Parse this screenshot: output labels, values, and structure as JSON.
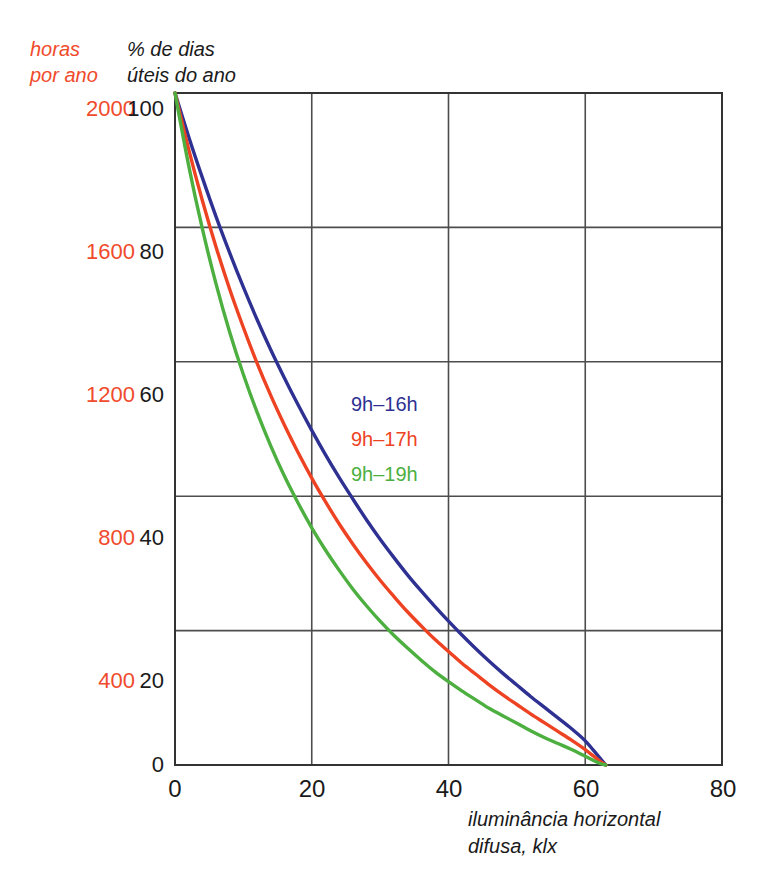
{
  "chart_data": {
    "type": "line",
    "title": "",
    "xlabel": "iluminância horizontal\ndifusa, klx",
    "ylabel": "% de dias\núteis do ano",
    "secondary_ylabel": "horas\npor ano",
    "xlim": [
      0,
      80
    ],
    "ylim": [
      0,
      100
    ],
    "secondary_ylim": [
      0,
      2000
    ],
    "xticks": [
      "0",
      "20",
      "40",
      "60",
      "80"
    ],
    "xtick_values": [
      0,
      20,
      40,
      60,
      80
    ],
    "yticks": [
      "0",
      "20",
      "40",
      "60",
      "80",
      "100"
    ],
    "ytick_values": [
      0,
      20,
      40,
      60,
      80,
      100
    ],
    "secondary_yticks": [
      "400",
      "800",
      "1200",
      "1600",
      "2000"
    ],
    "secondary_ytick_values": [
      400,
      800,
      1200,
      1600,
      2000
    ],
    "grid": true,
    "legend_position": "inside-center",
    "x": [
      0,
      2,
      4,
      6,
      8,
      10,
      12,
      14,
      16,
      18,
      20,
      22,
      24,
      26,
      28,
      30,
      32,
      34,
      36,
      38,
      40,
      42,
      44,
      46,
      48,
      50,
      52,
      54,
      56,
      58,
      60,
      62,
      63
    ],
    "series": [
      {
        "name": "9h–16h",
        "color": "#2e3192",
        "values": [
          100,
          93.5,
          87.4,
          81.6,
          76.2,
          71.1,
          66.3,
          61.8,
          57.6,
          53.6,
          49.8,
          46.2,
          42.8,
          39.6,
          36.5,
          33.6,
          30.9,
          28.3,
          25.9,
          23.6,
          21.4,
          19.3,
          17.3,
          15.4,
          13.6,
          11.9,
          10.2,
          8.6,
          7.0,
          5.4,
          3.6,
          1.2,
          0
        ]
      },
      {
        "name": "9h–17h",
        "color": "#ee4323",
        "values": [
          100,
          91.6,
          84.0,
          77.1,
          70.8,
          65.1,
          59.8,
          55.0,
          50.6,
          46.5,
          42.7,
          39.2,
          35.9,
          32.9,
          30.1,
          27.5,
          25.1,
          22.8,
          20.7,
          18.7,
          16.9,
          15.1,
          13.5,
          11.9,
          10.4,
          9.0,
          7.6,
          6.3,
          5.0,
          3.7,
          2.3,
          0.7,
          0
        ]
      },
      {
        "name": "9h–19h",
        "color": "#4caf3f",
        "values": [
          100,
          89.2,
          79.8,
          71.6,
          64.4,
          58.1,
          52.5,
          47.5,
          43.0,
          39.0,
          35.3,
          32.0,
          29.0,
          26.2,
          23.7,
          21.4,
          19.3,
          17.4,
          15.6,
          13.9,
          12.4,
          11.0,
          9.7,
          8.4,
          7.3,
          6.2,
          5.1,
          4.1,
          3.2,
          2.3,
          1.3,
          0.3,
          0
        ]
      }
    ],
    "legend": [
      {
        "label": "9h–16h",
        "color": "#2e3192"
      },
      {
        "label": "9h–17h",
        "color": "#ee4323"
      },
      {
        "label": "9h–19h",
        "color": "#4caf3f"
      }
    ],
    "colors": {
      "secondary_axis": "#ef4b2c",
      "primary_axis": "#1a1a1a",
      "grid": "#4d4d4d",
      "frame": "#333333",
      "background": "#ffffff"
    }
  }
}
